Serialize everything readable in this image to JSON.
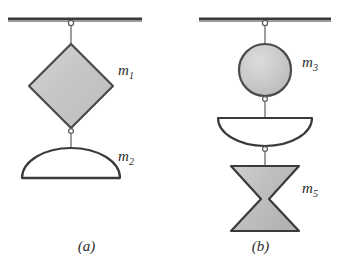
{
  "figure": {
    "background_color": "#ffffff",
    "ink_color": "#3a3a3a",
    "fill_gray": "#c8c8c8",
    "fill_white": "#ffffff"
  },
  "panels": [
    {
      "caption": "(a)",
      "support": "ceiling-line",
      "bodies": [
        {
          "label": "m",
          "subscript": "1",
          "shape": "diamond",
          "fill": "gray"
        },
        {
          "label": "m",
          "subscript": "2",
          "shape": "dome",
          "fill": "white"
        }
      ]
    },
    {
      "caption": "(b)",
      "support": "ceiling-line",
      "bodies": [
        {
          "label": "m",
          "subscript": "3",
          "shape": "circle",
          "fill": "gray"
        },
        {
          "label": "",
          "subscript": "",
          "shape": "inverted-bowl",
          "fill": "white"
        },
        {
          "label": "m",
          "subscript": "5",
          "shape": "hourglass",
          "fill": "gray"
        }
      ]
    }
  ],
  "labels": {
    "m1": "m",
    "m1_sub": "1",
    "m2": "m",
    "m2_sub": "2",
    "m3": "m",
    "m3_sub": "3",
    "m5": "m",
    "m5_sub": "5"
  },
  "captions": {
    "a": "(a)",
    "b": "(b)"
  }
}
